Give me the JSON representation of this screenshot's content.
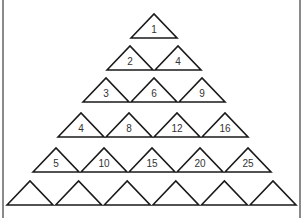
{
  "worksheet": {
    "title_partial": "",
    "triangle_width": 46,
    "triangle_height": 24,
    "rows": [
      {
        "row": 1,
        "base_y": 38,
        "start_x": 131,
        "step": 47,
        "labels": [
          "1"
        ]
      },
      {
        "row": 2,
        "base_y": 70,
        "start_x": 107,
        "step": 48,
        "labels": [
          "2",
          "4"
        ]
      },
      {
        "row": 3,
        "base_y": 102,
        "start_x": 83,
        "step": 48,
        "labels": [
          "3",
          "6",
          "9"
        ]
      },
      {
        "row": 4,
        "base_y": 137,
        "start_x": 58,
        "step": 48,
        "labels": [
          "4",
          "8",
          "12",
          "16"
        ]
      },
      {
        "row": 5,
        "base_y": 172,
        "start_x": 33,
        "step": 48,
        "labels": [
          "5",
          "10",
          "15",
          "20",
          "25"
        ]
      },
      {
        "row": 6,
        "base_y": 205,
        "start_x": 7,
        "step": 48.6,
        "labels": [
          "",
          "",
          "",
          "",
          "",
          ""
        ]
      }
    ]
  },
  "colors": {
    "stroke": "#1a1a1a",
    "border": "#8a8a8a",
    "text": "#333333"
  }
}
